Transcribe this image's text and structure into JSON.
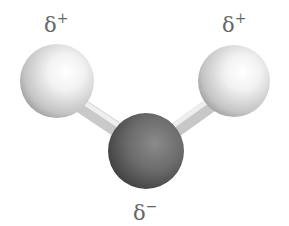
{
  "diagram": {
    "molecule": "water",
    "atoms": [
      {
        "id": "hydrogen-left",
        "element": "H",
        "cx": 57,
        "cy": 81,
        "r": 37,
        "color": "#e6e6e6",
        "charge_label": "δ",
        "charge_sign": "+"
      },
      {
        "id": "hydrogen-right",
        "element": "H",
        "cx": 234,
        "cy": 81,
        "r": 36,
        "color": "#e6e6e6",
        "charge_label": "δ",
        "charge_sign": "+"
      },
      {
        "id": "oxygen",
        "element": "O",
        "cx": 146,
        "cy": 151,
        "r": 38,
        "color": "#6e6e6e",
        "charge_label": "δ",
        "charge_sign": "−"
      }
    ],
    "bonds": [
      {
        "from": "hydrogen-left",
        "to": "oxygen"
      },
      {
        "from": "hydrogen-right",
        "to": "oxygen"
      }
    ],
    "labels": {
      "left_charge": {
        "base": "δ",
        "sup": "+"
      },
      "right_charge": {
        "base": "δ",
        "sup": "+"
      },
      "bottom_charge": {
        "base": "δ",
        "sup": "−"
      }
    }
  }
}
